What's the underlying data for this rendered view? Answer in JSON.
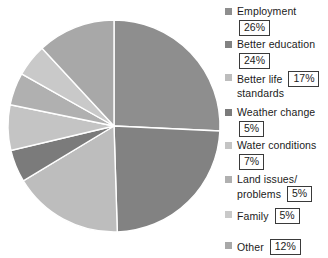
{
  "chart_data": {
    "type": "pie",
    "title": "",
    "subtitle": "",
    "xlabel": "",
    "ylabel": "",
    "legend_position": "right",
    "grid": false,
    "start_angle_deg": 0,
    "direction": "clockwise",
    "categories": [
      "Employment",
      "Better education",
      "Better life standards",
      "Weather change",
      "Water conditions",
      "Land issues/problems",
      "Family",
      "Other"
    ],
    "values": [
      26,
      24,
      17,
      5,
      7,
      5,
      5,
      12
    ],
    "value_labels": [
      "26%",
      "24%",
      "17%",
      "5%",
      "7%",
      "5%",
      "5%",
      "12%"
    ],
    "colors": [
      "#8e8e8e",
      "#828282",
      "#bdbdbd",
      "#7b7b7b",
      "#c4c4c4",
      "#b0b0b0",
      "#c9c9c9",
      "#a8a8a8"
    ],
    "units": "percent"
  },
  "legend": {
    "items": [
      {
        "label_line1": "Employment",
        "label_line2": "",
        "value": "26%",
        "color": "#8e8e8e",
        "swatch_name": "legend-swatch-employment"
      },
      {
        "label_line1": "Better education",
        "label_line2": "",
        "value": "24%",
        "color": "#828282",
        "swatch_name": "legend-swatch-better-education"
      },
      {
        "label_line1": "Better life",
        "label_line2": "standards",
        "value": "17%",
        "color": "#bdbdbd",
        "swatch_name": "legend-swatch-better-life-standards"
      },
      {
        "label_line1": "Weather change",
        "label_line2": "",
        "value": "5%",
        "color": "#7b7b7b",
        "swatch_name": "legend-swatch-weather-change"
      },
      {
        "label_line1": "Water conditions",
        "label_line2": "",
        "value": "7%",
        "color": "#c4c4c4",
        "swatch_name": "legend-swatch-water-conditions"
      },
      {
        "label_line1": "Land issues/",
        "label_line2": "problems",
        "value": "5%",
        "color": "#b0b0b0",
        "swatch_name": "legend-swatch-land-issues"
      },
      {
        "label_line1": "Family",
        "label_line2": "",
        "value": "5%",
        "color": "#c9c9c9",
        "swatch_name": "legend-swatch-family"
      },
      {
        "label_line1": "Other",
        "label_line2": "",
        "value": "12%",
        "color": "#a8a8a8",
        "swatch_name": "legend-swatch-other"
      }
    ]
  }
}
